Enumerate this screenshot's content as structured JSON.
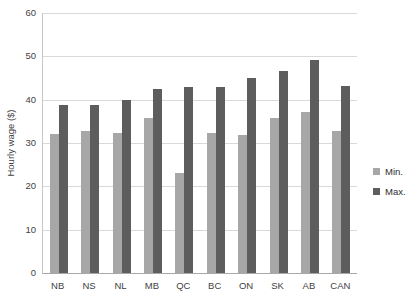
{
  "chart_data": {
    "type": "bar",
    "title": "",
    "xlabel": "",
    "ylabel": "Hourly wage ($)",
    "ylim": [
      0,
      60
    ],
    "ytick_interval": 10,
    "yticks": [
      0,
      10,
      20,
      30,
      40,
      50,
      60
    ],
    "grid": true,
    "legend_position": "right",
    "categories": [
      "NB",
      "NS",
      "NL",
      "MB",
      "QC",
      "BC",
      "ON",
      "SK",
      "AB",
      "CAN"
    ],
    "series": [
      {
        "name": "Min.",
        "color": "#a7a7a7",
        "values": [
          32.0,
          32.8,
          32.2,
          35.8,
          23.0,
          32.4,
          31.8,
          35.8,
          37.2,
          32.8
        ]
      },
      {
        "name": "Max.",
        "color": "#5d5d5d",
        "values": [
          38.8,
          38.8,
          40.0,
          42.4,
          42.9,
          42.9,
          45.0,
          46.6,
          49.1,
          43.2
        ]
      }
    ]
  },
  "colors": {
    "background": "#ffffff",
    "gridline": "#d9d9d9",
    "axis_line": "#a8a8a8",
    "label_text": "#3f3f3f"
  },
  "legend": {
    "min_label": "Min.",
    "max_label": "Max."
  }
}
